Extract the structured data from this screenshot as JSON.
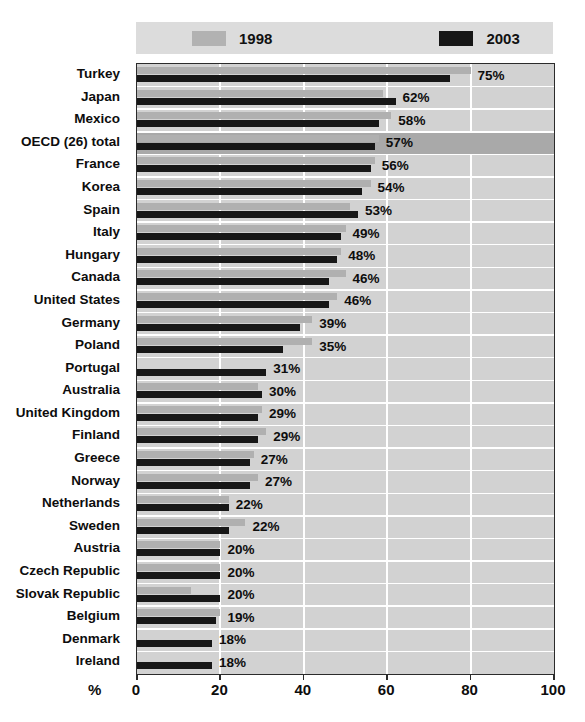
{
  "title": "",
  "legend": {
    "items": [
      {
        "label": "1998",
        "color": "#b0b0b0",
        "icon": "legend-swatch-1998"
      },
      {
        "label": "2003",
        "color": "#171717",
        "icon": "legend-swatch-2003"
      }
    ]
  },
  "axis": {
    "unit_label": "%",
    "ticks": [
      "0",
      "20",
      "40",
      "60",
      "80",
      "100"
    ]
  },
  "colors": {
    "series_1998": "#b0b0b0",
    "series_2003": "#171717",
    "plot_background": "#d2d2d2",
    "highlight_row": "#a9a9a9",
    "gridline": "#ffffff",
    "legend_background": "#dcdcdc",
    "axis_line": "#2b2b2b"
  },
  "chart_data": {
    "type": "bar",
    "orientation": "horizontal",
    "title": "",
    "xlabel": "%",
    "ylabel": "",
    "xlim": [
      0,
      100
    ],
    "xticks": [
      0,
      20,
      40,
      60,
      80,
      100
    ],
    "grid": "vertical",
    "legend_position": "top",
    "categories": [
      "Turkey",
      "Japan",
      "Mexico",
      "OECD (26) total",
      "France",
      "Korea",
      "Spain",
      "Italy",
      "Hungary",
      "Canada",
      "United States",
      "Germany",
      "Poland",
      "Portugal",
      "Australia",
      "United Kingdom",
      "Finland",
      "Greece",
      "Norway",
      "Netherlands",
      "Sweden",
      "Austria",
      "Czech Republic",
      "Slovak Republic",
      "Belgium",
      "Denmark",
      "Ireland"
    ],
    "highlighted_category": "OECD (26) total",
    "series": [
      {
        "name": "1998",
        "values": [
          80,
          59,
          61,
          58,
          57,
          56,
          51,
          50,
          49,
          50,
          48,
          42,
          42,
          0,
          29,
          30,
          31,
          28,
          29,
          22,
          26,
          20,
          20,
          13,
          20,
          0,
          0
        ]
      },
      {
        "name": "2003",
        "values": [
          75,
          62,
          58,
          57,
          56,
          54,
          53,
          49,
          48,
          46,
          46,
          39,
          35,
          31,
          30,
          29,
          29,
          27,
          27,
          22,
          22,
          20,
          20,
          20,
          19,
          18,
          18
        ]
      }
    ],
    "data_labels": [
      "75%",
      "62%",
      "58%",
      "57%",
      "56%",
      "54%",
      "53%",
      "49%",
      "48%",
      "46%",
      "46%",
      "39%",
      "35%",
      "31%",
      "30%",
      "29%",
      "29%",
      "27%",
      "27%",
      "22%",
      "22%",
      "20%",
      "20%",
      "20%",
      "19%",
      "18%",
      "18%"
    ]
  }
}
